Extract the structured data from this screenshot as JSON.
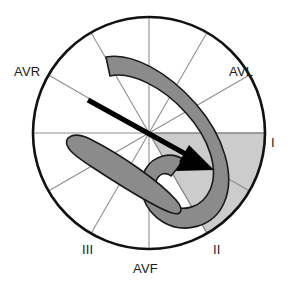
{
  "diagram": {
    "type": "ecg-axis-wheel",
    "center": {
      "x": 149,
      "y": 133
    },
    "radius": 116,
    "colors": {
      "circle_stroke": "#111111",
      "axis_line": "#8f8f8f",
      "loop_fill": "#8b8b8b",
      "loop_stroke": "#1a1a1a",
      "sector_fill": "#cccccc",
      "sector_stroke": "#5a5a5a",
      "arrow_fill": "#000000",
      "background": "#ffffff",
      "label_text": "#1a1a1a"
    },
    "labels": [
      {
        "id": "avr",
        "text": "AVR",
        "angle_deg": -150
      },
      {
        "id": "avl",
        "text": "AVL",
        "angle_deg": -30
      },
      {
        "id": "i",
        "text": "I",
        "angle_deg": 0
      },
      {
        "id": "ii",
        "text": "II",
        "angle_deg": 60
      },
      {
        "id": "iii",
        "text": "III",
        "angle_deg": 120
      },
      {
        "id": "avf",
        "text": "AVF",
        "angle_deg": 90
      }
    ],
    "axes_deg": [
      0,
      30,
      60,
      90,
      120,
      150,
      180,
      210,
      240,
      270,
      300,
      330
    ],
    "shaded_sector": {
      "start_deg": 0,
      "end_deg": 60
    },
    "mean_axis_arrow": {
      "tail": {
        "x": 88,
        "y": 100
      },
      "tip": {
        "x": 214,
        "y": 170
      },
      "angle_deg": 29
    }
  }
}
